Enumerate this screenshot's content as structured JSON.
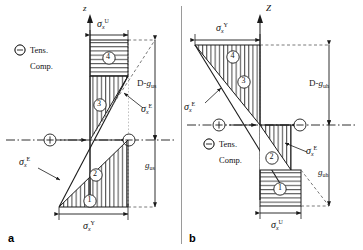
{
  "figure": {
    "type": "engineering-stress-distribution-diagram",
    "panels": [
      {
        "id": "a",
        "id_label": "a",
        "axis_label": "z",
        "legend": [
          {
            "symbol": "plus-circle",
            "label": "Tens."
          },
          {
            "symbol": "minus-circle",
            "label": "Comp."
          }
        ],
        "dimensions": [
          {
            "name": "sigma-x-U",
            "base": "σ",
            "sub": "x",
            "sup": "U",
            "position": "top-horizontal"
          },
          {
            "name": "D-minus-g-us",
            "text": "D-g",
            "sub": "us",
            "position": "right-upper-vertical"
          },
          {
            "name": "g-us",
            "text": "g",
            "sub": "us",
            "position": "right-lower-vertical"
          },
          {
            "name": "sigma-x-Y",
            "base": "σ",
            "sub": "x",
            "sup": "Y",
            "position": "bottom-horizontal"
          }
        ],
        "callouts": [
          {
            "name": "sigma-x-E",
            "base": "σ",
            "sub": "x",
            "sup": "E",
            "position": "mid-right"
          },
          {
            "name": "sigma-x-E-lower",
            "base": "σ",
            "sub": "x",
            "sup": "E",
            "position": "mid-left"
          }
        ],
        "regions": [
          {
            "number": "4",
            "hatch": "horizontal"
          },
          {
            "number": "3",
            "hatch": "vertical"
          },
          {
            "number": "2",
            "hatch": "vertical"
          },
          {
            "number": "1",
            "hatch": "vertical"
          }
        ],
        "neutral_axis_markers": [
          {
            "symbol": "plus-circle",
            "side": "left"
          },
          {
            "symbol": "minus-circle",
            "side": "right"
          }
        ]
      },
      {
        "id": "b",
        "id_label": "b",
        "axis_label": "Z",
        "legend": [
          {
            "symbol": "plus-circle",
            "label": "Tens."
          },
          {
            "symbol": "minus-circle",
            "label": "Comp."
          }
        ],
        "dimensions": [
          {
            "name": "sigma-x-Y",
            "base": "σ",
            "sub": "x",
            "sup": "Y",
            "position": "top-horizontal"
          },
          {
            "name": "D-minus-g-uh",
            "text": "D-g",
            "sub": "uh",
            "position": "right-upper-vertical"
          },
          {
            "name": "g-uh",
            "text": "g",
            "sub": "uh",
            "position": "right-lower-vertical"
          },
          {
            "name": "sigma-x-U",
            "base": "σ",
            "sub": "x",
            "sup": "U",
            "position": "bottom-horizontal"
          }
        ],
        "callouts": [
          {
            "name": "sigma-x-E",
            "base": "σ",
            "sub": "x",
            "sup": "E",
            "position": "upper-left"
          },
          {
            "name": "sigma-x-E-lower",
            "base": "σ",
            "sub": "x",
            "sup": "E",
            "position": "mid-right"
          }
        ],
        "regions": [
          {
            "number": "4",
            "hatch": "vertical"
          },
          {
            "number": "3",
            "hatch": "vertical"
          },
          {
            "number": "2",
            "hatch": "vertical"
          },
          {
            "number": "1",
            "hatch": "horizontal"
          }
        ],
        "neutral_axis_markers": [
          {
            "symbol": "plus-circle",
            "side": "left"
          },
          {
            "symbol": "minus-circle",
            "side": "right"
          }
        ]
      }
    ],
    "colors": {
      "line": "#1a1a1a",
      "hatch": "#3a3a3a",
      "dashed": "#6b6b6b",
      "background": "#ffffff"
    }
  }
}
